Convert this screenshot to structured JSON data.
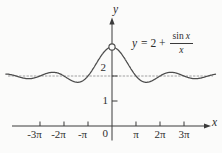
{
  "figure": {
    "y_axis_label": "y",
    "x_axis_label": "x",
    "origin_label": "0",
    "formula": {
      "lhs_var": "y",
      "mid": "= 2 +",
      "num_fn": "sin",
      "num_var": "x",
      "den_var": "x"
    }
  },
  "chart_data": {
    "type": "line",
    "title": "",
    "annotation": "y = 2 + (sin x)/x",
    "function": "y = 2 + sin(x)/x",
    "xlabel": "x",
    "ylabel": "y",
    "x_range_radians": [
      -13.9,
      13.55
    ],
    "ylim": [
      0,
      3.5
    ],
    "grid": false,
    "asymptote": {
      "y": 2,
      "style": "fine-dashed"
    },
    "hole": {
      "x": 0,
      "y_limit": 3,
      "open_circle": true
    },
    "x_ticks": [
      {
        "label": "-3π",
        "value_radians": -9.42478
      },
      {
        "label": "-2π",
        "value_radians": -6.28319
      },
      {
        "label": "-π",
        "value_radians": -3.14159
      },
      {
        "label": "π",
        "value_radians": 3.14159
      },
      {
        "label": "2π",
        "value_radians": 6.28319
      },
      {
        "label": "3π",
        "value_radians": 9.42478
      }
    ],
    "y_ticks": [
      {
        "label": "1",
        "value": 1
      },
      {
        "label": "2",
        "value": 2
      }
    ],
    "key_points": [
      {
        "x": 0,
        "y": 3,
        "note": "removable discontinuity shown as open circle; limit value 3"
      },
      {
        "x": 3.14159,
        "y": 2,
        "note": "curve crosses the line y=2 at every multiple of pi"
      },
      {
        "x": 4.493,
        "y": 1.783,
        "note": "first local minimum right of origin"
      },
      {
        "x": 7.725,
        "y": 2.129,
        "note": "second local maximum"
      },
      {
        "x": 10.904,
        "y": 1.908,
        "note": "local minimum"
      },
      {
        "x": -4.493,
        "y": 1.783,
        "note": "mirror minimum (even function)"
      }
    ]
  }
}
